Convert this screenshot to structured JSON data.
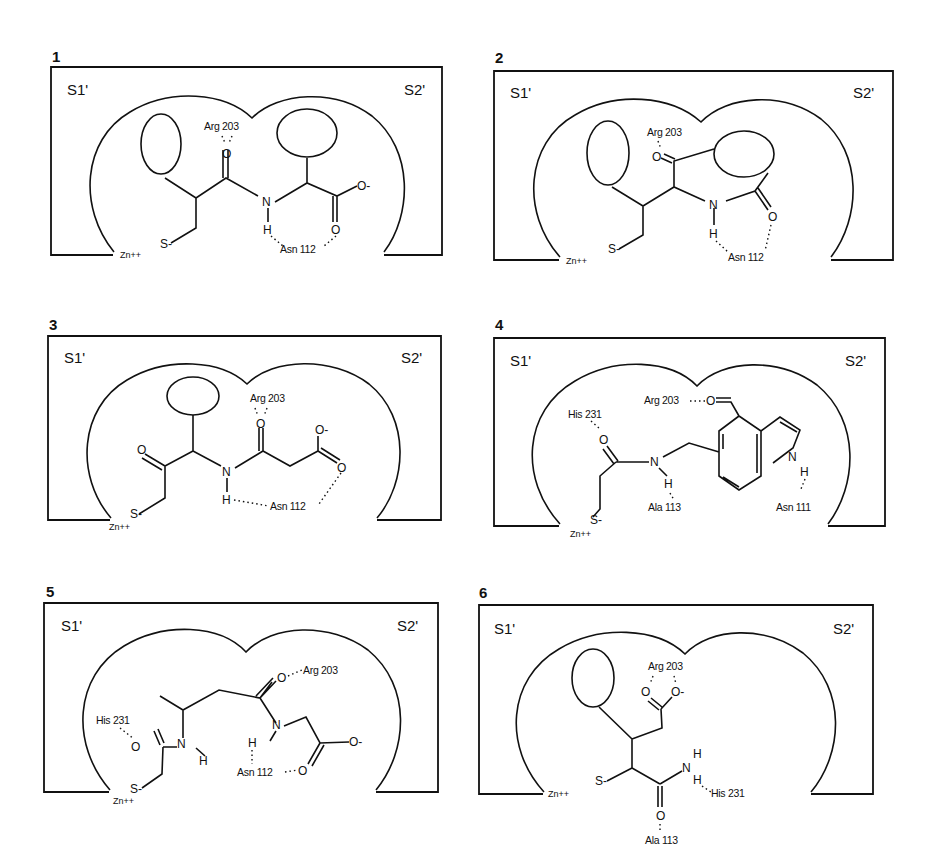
{
  "figure": {
    "type": "binding-site schematics",
    "panels": [
      {
        "id": "1",
        "label": "1",
        "sites": {
          "left": "S1'",
          "right": "S2'"
        },
        "metal": "Zn++",
        "thiolate": "S-",
        "residues": [
          "Arg 203",
          "Asn 112"
        ],
        "atoms": {
          "carbonyl_o": "O",
          "amide_n": "N",
          "amide_h": "H",
          "carboxylate_o_minus": "O-",
          "carboxylate_o": "O"
        }
      },
      {
        "id": "2",
        "label": "2",
        "sites": {
          "left": "S1'",
          "right": "S2'"
        },
        "metal": "Zn++",
        "thiolate": "S-",
        "residues": [
          "Arg 203",
          "Asn 112"
        ],
        "atoms": {
          "carbonyl_o": "O",
          "amide_n": "N",
          "amide_h": "H",
          "acetyl_o": "O"
        }
      },
      {
        "id": "3",
        "label": "3",
        "sites": {
          "left": "S1'",
          "right": "S2'"
        },
        "metal": "Zn++",
        "thiolate": "S-",
        "residues": [
          "Arg 203",
          "Asn 112"
        ],
        "atoms": {
          "ketone_o": "O",
          "amide_n": "N",
          "amide_h": "H",
          "amide_o": "O",
          "carboxylate_o_minus": "O-",
          "carboxylate_o": "O"
        }
      },
      {
        "id": "4",
        "label": "4",
        "sites": {
          "left": "S1'",
          "right": "S2'"
        },
        "metal": "Zn++",
        "thiolate": "S-",
        "residues": [
          "Arg 203",
          "His 231",
          "Ala 113",
          "Asn 111"
        ],
        "atoms": {
          "aldehyde_o": "O",
          "amide_o": "O",
          "amide_n": "N",
          "amide_h": "H",
          "indole_n": "N",
          "indole_h": "H"
        }
      },
      {
        "id": "5",
        "label": "5",
        "sites": {
          "left": "S1'",
          "right": "S2'"
        },
        "metal": "Zn++",
        "thiolate": "S-",
        "residues": [
          "Arg 203",
          "His 231",
          "Asn 112"
        ],
        "atoms": {
          "amide1_o": "O",
          "amide1_n": "N",
          "amide1_h": "H",
          "amide2_o": "O",
          "amide2_n": "N",
          "amide2_h": "H",
          "carboxylate_o_minus": "O-",
          "carboxylate_o": "O"
        }
      },
      {
        "id": "6",
        "label": "6",
        "sites": {
          "left": "S1'",
          "right": "S2'"
        },
        "metal": "Zn++",
        "thiolate": "S-",
        "residues": [
          "Arg 203",
          "His 231",
          "Ala 113"
        ],
        "atoms": {
          "carboxylate_o": "O",
          "carboxylate_o_minus": "O-",
          "amide_n": "N",
          "amide_h1": "H",
          "amide_h2": "H",
          "amide_o": "O"
        }
      }
    ]
  }
}
